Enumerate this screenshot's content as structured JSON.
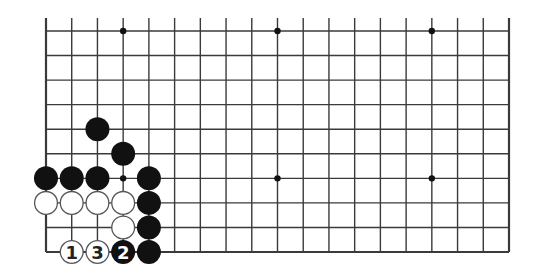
{
  "diagram": {
    "type": "go-board-fragment",
    "columns": 19,
    "rows_shown": 10,
    "bottom_edge": true,
    "top_edge": false,
    "left_edge": true,
    "right_edge": true,
    "star_points": [
      [
        3,
        0
      ],
      [
        9,
        0
      ],
      [
        15,
        0
      ],
      [
        3,
        6
      ],
      [
        9,
        6
      ],
      [
        15,
        6
      ]
    ],
    "stones": [
      {
        "col": 2,
        "row": 4,
        "color": "black",
        "label": ""
      },
      {
        "col": 3,
        "row": 5,
        "color": "black",
        "label": ""
      },
      {
        "col": 0,
        "row": 6,
        "color": "black",
        "label": ""
      },
      {
        "col": 1,
        "row": 6,
        "color": "black",
        "label": ""
      },
      {
        "col": 2,
        "row": 6,
        "color": "black",
        "label": ""
      },
      {
        "col": 4,
        "row": 6,
        "color": "black",
        "label": ""
      },
      {
        "col": 0,
        "row": 7,
        "color": "white",
        "label": ""
      },
      {
        "col": 1,
        "row": 7,
        "color": "white",
        "label": ""
      },
      {
        "col": 2,
        "row": 7,
        "color": "white",
        "label": ""
      },
      {
        "col": 3,
        "row": 7,
        "color": "white",
        "label": ""
      },
      {
        "col": 4,
        "row": 7,
        "color": "black",
        "label": ""
      },
      {
        "col": 3,
        "row": 8,
        "color": "white",
        "label": ""
      },
      {
        "col": 4,
        "row": 8,
        "color": "black",
        "label": ""
      },
      {
        "col": 1,
        "row": 9,
        "color": "white",
        "label": "1"
      },
      {
        "col": 2,
        "row": 9,
        "color": "white",
        "label": "3"
      },
      {
        "col": 3,
        "row": 9,
        "color": "black",
        "label": "2"
      },
      {
        "col": 4,
        "row": 9,
        "color": "black",
        "label": ""
      }
    ],
    "colors": {
      "line": "#3a3a3a",
      "black_stone": "#111111",
      "white_stone": "#ffffff",
      "white_outline": "#555555",
      "background": "#ffffff"
    }
  }
}
